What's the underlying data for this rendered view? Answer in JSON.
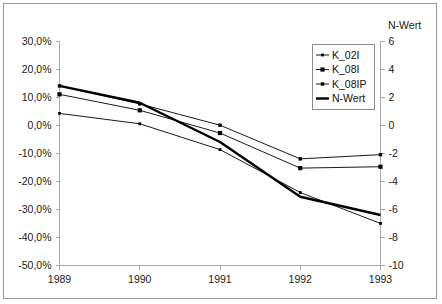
{
  "chart_data": {
    "type": "line",
    "title": "",
    "subtitle": "",
    "xlabel": "",
    "ylabel": "",
    "y2label": "N-Wert",
    "grid": false,
    "legend_position": "top-right",
    "categories": [
      "1989",
      "1990",
      "1991",
      "1992",
      "1993"
    ],
    "x_tick_labels": [
      "1989",
      "1990",
      "1991",
      "1992",
      "1993"
    ],
    "ylim": [
      -50,
      30
    ],
    "y_tick_labels": [
      "30,0%",
      "20,0%",
      "10,0%",
      "0,0%",
      "-10,0%",
      "-20,0%",
      "-30,0%",
      "-40,0%",
      "-50,0%"
    ],
    "y_tick_values": [
      30,
      20,
      10,
      0,
      -10,
      -20,
      -30,
      -40,
      -50
    ],
    "y2lim": [
      -10,
      6
    ],
    "y2_tick_labels": [
      "6",
      "4",
      "2",
      "0",
      "-2",
      "-4",
      "-6",
      "-8",
      "-10"
    ],
    "y2_tick_values": [
      6,
      4,
      2,
      0,
      -2,
      -4,
      -6,
      -8,
      -10
    ],
    "series": [
      {
        "name": "K_02I",
        "axis": "left",
        "marker": "small-dot",
        "line_weight": "thin",
        "values": [
          4.2,
          0.5,
          -8.7,
          -24.0,
          -35.0
        ]
      },
      {
        "name": "K_08I",
        "axis": "left",
        "marker": "square",
        "line_weight": "thin",
        "values": [
          11.0,
          5.3,
          -2.8,
          -15.3,
          -14.8
        ]
      },
      {
        "name": "K_08IP",
        "axis": "left",
        "marker": "triangle",
        "line_weight": "thin",
        "values": [
          14.0,
          7.6,
          0.0,
          -12.0,
          -10.5
        ]
      },
      {
        "name": "N-Wert",
        "axis": "right",
        "marker": "none",
        "line_weight": "thick",
        "values": [
          2.8,
          1.6,
          -1.2,
          -5.1,
          -6.4
        ]
      }
    ],
    "legend_entries": [
      "K_02I",
      "K_08I",
      "K_08IP",
      "N-Wert"
    ],
    "colors": {
      "line": "#000000",
      "axis": "#a8a8a8",
      "text": "#1a1a1a",
      "frame": "#9a9a9a",
      "background": "#ffffff"
    }
  }
}
